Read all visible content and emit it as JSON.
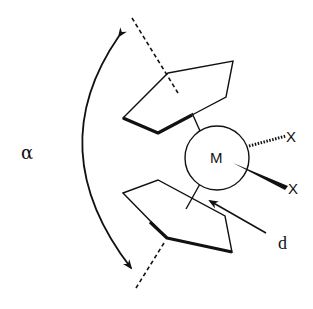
{
  "diagram": {
    "labels": {
      "angle": "α",
      "metal": "M",
      "ligand_top": "X",
      "ligand_bottom": "X",
      "distance": "d"
    },
    "colors": {
      "stroke": "#111111",
      "background": "#ffffff"
    }
  }
}
